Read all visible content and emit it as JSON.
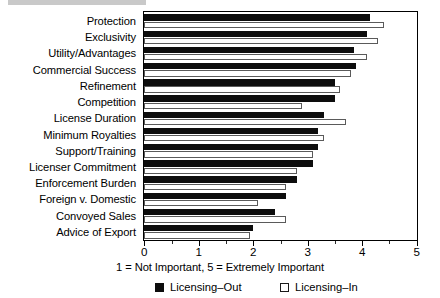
{
  "chart_data": {
    "type": "bar",
    "orientation": "horizontal",
    "title": "",
    "subtitle": "",
    "xlabel": "1 = Not Important, 5 = Extremely Important",
    "ylabel": "",
    "xlim": [
      0,
      5
    ],
    "xticks": [
      "0",
      "1",
      "2",
      "3",
      "4",
      "5"
    ],
    "xtick_values": [
      0,
      1,
      2,
      3,
      4,
      5
    ],
    "minor_ticks": [
      0.5,
      1.5,
      2.5,
      3.5,
      4.5
    ],
    "grid": false,
    "legend_position": "bottom",
    "categories": [
      "Protection",
      "Exclusivity",
      "Utility/Advantages",
      "Commercial Success",
      "Refinement",
      "Competition",
      "License Duration",
      "Minimum Royalties",
      "Support/Training",
      "Licenser Commitment",
      "Enforcement Burden",
      "Foreign v. Domestic",
      "Convoyed Sales",
      "Advice of Export"
    ],
    "series": [
      {
        "name": "Licensing–Out",
        "color": "#0d0d0d",
        "style": "filled",
        "values": [
          4.15,
          4.1,
          3.85,
          3.9,
          3.5,
          3.5,
          3.3,
          3.2,
          3.2,
          3.1,
          2.8,
          2.6,
          2.4,
          2.0
        ]
      },
      {
        "name": "Licensing–In",
        "color": "#ffffff",
        "style": "hollow",
        "values": [
          4.4,
          4.3,
          4.1,
          3.8,
          3.6,
          2.9,
          3.7,
          3.3,
          3.1,
          2.8,
          2.6,
          2.1,
          2.6,
          1.95
        ]
      }
    ]
  },
  "legend": {
    "items": [
      {
        "label": "Licensing–Out",
        "swatch": "filled-square-icon"
      },
      {
        "label": "Licensing–In",
        "swatch": "hollow-square-icon"
      }
    ]
  }
}
